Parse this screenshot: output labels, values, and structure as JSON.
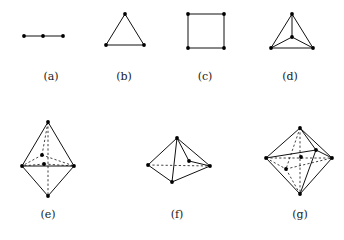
{
  "figure": {
    "title": "",
    "background_color": "#ffffff",
    "line_color": "#111111",
    "vertex_color": "#000000",
    "label_color": "#1a1a1a",
    "panels": [
      {
        "id": "a",
        "label": "(a)",
        "name": "path-graph-three-vertices",
        "label_x": 51,
        "label_y": 70,
        "origin_x": 18,
        "origin_y": 22,
        "width": 70,
        "height": 40,
        "vertices": [
          {
            "x": 6,
            "y": 14
          },
          {
            "x": 25,
            "y": 14
          },
          {
            "x": 45,
            "y": 14
          }
        ],
        "solid_edges": [
          [
            0,
            1
          ],
          [
            1,
            2
          ]
        ],
        "dashed_edges": []
      },
      {
        "id": "b",
        "label": "(b)",
        "name": "triangle-graph",
        "label_x": 124,
        "label_y": 70,
        "origin_x": 100,
        "origin_y": 10,
        "width": 60,
        "height": 50,
        "vertices": [
          {
            "x": 25,
            "y": 4
          },
          {
            "x": 6,
            "y": 35
          },
          {
            "x": 44,
            "y": 35
          }
        ],
        "solid_edges": [
          [
            0,
            1
          ],
          [
            0,
            2
          ],
          [
            1,
            2
          ]
        ],
        "dashed_edges": []
      },
      {
        "id": "c",
        "label": "(c)",
        "name": "square-graph",
        "label_x": 205,
        "label_y": 70,
        "origin_x": 182,
        "origin_y": 10,
        "width": 60,
        "height": 50,
        "vertices": [
          {
            "x": 6,
            "y": 4
          },
          {
            "x": 42,
            "y": 4
          },
          {
            "x": 42,
            "y": 38
          },
          {
            "x": 6,
            "y": 38
          }
        ],
        "solid_edges": [
          [
            0,
            1
          ],
          [
            1,
            2
          ],
          [
            2,
            3
          ],
          [
            3,
            0
          ]
        ],
        "dashed_edges": []
      },
      {
        "id": "d",
        "label": "(d)",
        "name": "tetrahedron-projection",
        "label_x": 290,
        "label_y": 70,
        "origin_x": 265,
        "origin_y": 10,
        "width": 60,
        "height": 50,
        "vertices": [
          {
            "x": 27,
            "y": 4
          },
          {
            "x": 6,
            "y": 38
          },
          {
            "x": 48,
            "y": 38
          },
          {
            "x": 27,
            "y": 27
          }
        ],
        "solid_edges": [
          [
            0,
            1
          ],
          [
            0,
            2
          ],
          [
            1,
            2
          ],
          [
            3,
            0
          ],
          [
            3,
            1
          ],
          [
            3,
            2
          ]
        ],
        "dashed_edges": []
      },
      {
        "id": "e",
        "label": "(e)",
        "name": "bipyramid-with-interior-vertices",
        "label_x": 48,
        "label_y": 208,
        "origin_x": 18,
        "origin_y": 118,
        "width": 66,
        "height": 82,
        "vertices": [
          {
            "x": 30,
            "y": 4
          },
          {
            "x": 4,
            "y": 48
          },
          {
            "x": 56,
            "y": 48
          },
          {
            "x": 30,
            "y": 78
          },
          {
            "x": 24,
            "y": 37
          },
          {
            "x": 26,
            "y": 46
          }
        ],
        "solid_edges": [
          [
            0,
            1
          ],
          [
            0,
            2
          ],
          [
            1,
            2
          ],
          [
            1,
            3
          ],
          [
            2,
            3
          ]
        ],
        "dashed_edges": [
          [
            0,
            3
          ],
          [
            4,
            1
          ],
          [
            4,
            2
          ],
          [
            4,
            0
          ],
          [
            5,
            1
          ],
          [
            5,
            2
          ]
        ]
      },
      {
        "id": "f",
        "label": "(f)",
        "name": "square-pyramid-with-interior-vertex",
        "label_x": 177,
        "label_y": 208,
        "origin_x": 142,
        "origin_y": 134,
        "width": 76,
        "height": 60,
        "vertices": [
          {
            "x": 35,
            "y": 4
          },
          {
            "x": 6,
            "y": 31
          },
          {
            "x": 30,
            "y": 48
          },
          {
            "x": 68,
            "y": 32
          },
          {
            "x": 47,
            "y": 27
          }
        ],
        "solid_edges": [
          [
            0,
            1
          ],
          [
            0,
            3
          ],
          [
            1,
            2
          ],
          [
            2,
            3
          ],
          [
            0,
            2
          ],
          [
            3,
            4
          ],
          [
            0,
            4
          ]
        ],
        "dashed_edges": [
          [
            1,
            3
          ]
        ]
      },
      {
        "id": "g",
        "label": "(g)",
        "name": "octahedron-with-center-vertex",
        "label_x": 300,
        "label_y": 208,
        "origin_x": 262,
        "origin_y": 124,
        "width": 76,
        "height": 76,
        "vertices": [
          {
            "x": 38,
            "y": 4
          },
          {
            "x": 4,
            "y": 34
          },
          {
            "x": 70,
            "y": 34
          },
          {
            "x": 38,
            "y": 70
          },
          {
            "x": 54,
            "y": 26
          },
          {
            "x": 24,
            "y": 45
          },
          {
            "x": 39,
            "y": 33
          }
        ],
        "solid_edges": [
          [
            0,
            1
          ],
          [
            0,
            2
          ],
          [
            1,
            3
          ],
          [
            2,
            3
          ],
          [
            0,
            4
          ],
          [
            4,
            2
          ],
          [
            4,
            3
          ],
          [
            1,
            4
          ]
        ],
        "dashed_edges": [
          [
            0,
            5
          ],
          [
            5,
            2
          ],
          [
            5,
            3
          ],
          [
            1,
            5
          ],
          [
            0,
            3
          ],
          [
            1,
            2
          ]
        ]
      }
    ]
  }
}
